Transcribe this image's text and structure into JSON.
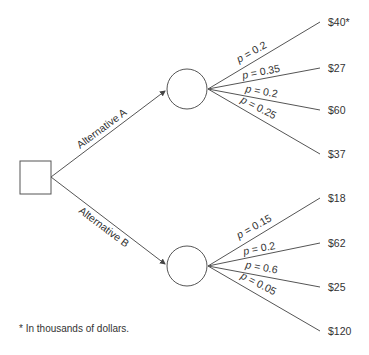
{
  "decision_node": {
    "label": ""
  },
  "alternatives": [
    {
      "label": "Alternative A",
      "outcomes": [
        {
          "prob_label": "p = 0.2",
          "p": "p",
          "value_text": " = 0.2",
          "payoff": "$40*"
        },
        {
          "prob_label": "p = 0.35",
          "p": "p",
          "value_text": " = 0.35",
          "payoff": "$27"
        },
        {
          "prob_label": "p = 0.2",
          "p": "p",
          "value_text": " = 0.2",
          "payoff": "$60"
        },
        {
          "prob_label": "p = 0.25",
          "p": "p",
          "value_text": " = 0.25",
          "payoff": "$37"
        }
      ]
    },
    {
      "label": "Alternative B",
      "outcomes": [
        {
          "prob_label": "p = 0.15",
          "p": "p",
          "value_text": " = 0.15",
          "payoff": "$18"
        },
        {
          "prob_label": "p = 0.2",
          "p": "p",
          "value_text": " = 0.2",
          "payoff": "$62"
        },
        {
          "prob_label": "p = 0.6",
          "p": "p",
          "value_text": " = 0.6",
          "payoff": "$25"
        },
        {
          "prob_label": "p = 0.05",
          "p": "p",
          "value_text": " = 0.05",
          "payoff": "$120"
        }
      ]
    }
  ],
  "footnote": "* In thousands of dollars.",
  "colors": {
    "line": "#555555",
    "text": "#333333",
    "background": "#ffffff"
  }
}
